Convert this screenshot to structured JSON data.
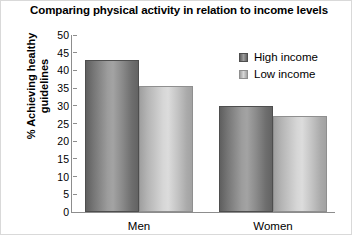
{
  "chart_data": {
    "type": "bar",
    "title": "Comparing physical activity in relation to income levels",
    "xlabel": "",
    "ylabel": "% Achieving healthy guidelines",
    "categories": [
      "Men",
      "Women"
    ],
    "series": [
      {
        "name": "High income",
        "values": [
          43,
          30
        ],
        "color": "#8a8a8a"
      },
      {
        "name": "Low income",
        "values": [
          35.5,
          27
        ],
        "color": "#c8c8c8"
      }
    ],
    "ylim": [
      0,
      50
    ],
    "yticks": [
      50,
      45,
      40,
      35,
      30,
      25,
      20,
      15,
      10,
      5,
      0
    ],
    "grid": false,
    "legend_position": "top-right"
  },
  "legend": {
    "entries": [
      {
        "label": "High income",
        "swatch": "high"
      },
      {
        "label": "Low income",
        "swatch": "low"
      }
    ]
  }
}
